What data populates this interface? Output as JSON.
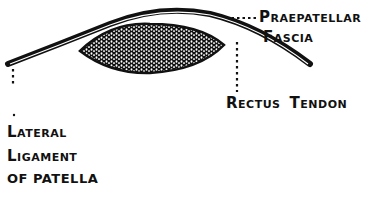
{
  "diagram": {
    "type": "anatomical-cross-section",
    "ink_color": "#111111",
    "background": "#ffffff",
    "labels": {
      "praepatellar": {
        "line1_first": "P",
        "line1_rest": "RAEPATELLAR",
        "line2_first": "F",
        "line2_rest": "ASCIA"
      },
      "rectus": {
        "word1_first": "R",
        "word1_rest": "ECTUS",
        "word2_first": "T",
        "word2_rest": "ENDON"
      },
      "lateral": {
        "line1_first": "L",
        "line1_rest": "ATERAL",
        "line2_first": "L",
        "line2_rest": "IGAMENT",
        "line3": "OF PATELLA"
      }
    }
  }
}
